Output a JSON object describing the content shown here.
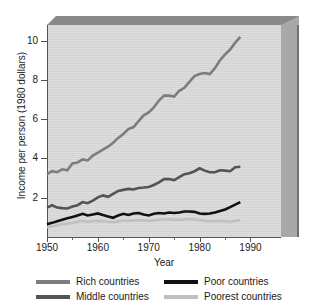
{
  "chart_data": {
    "type": "line",
    "title": "",
    "xlabel": "Year",
    "ylabel": "Income per person (1980 dollars)",
    "xlim": [
      1950,
      1996
    ],
    "ylim": [
      0,
      10.8
    ],
    "xticks": [
      1950,
      1960,
      1970,
      1980,
      1990
    ],
    "xticks_minor": [
      1955,
      1965,
      1975,
      1985
    ],
    "yticks": [
      2,
      4,
      6,
      8,
      10
    ],
    "grid": false,
    "legend_position": "below",
    "x": [
      1950,
      1951,
      1952,
      1953,
      1954,
      1955,
      1956,
      1957,
      1958,
      1959,
      1960,
      1961,
      1962,
      1963,
      1964,
      1965,
      1966,
      1967,
      1968,
      1969,
      1970,
      1971,
      1972,
      1973,
      1974,
      1975,
      1976,
      1977,
      1978,
      1979,
      1980,
      1981,
      1982,
      1983,
      1984,
      1985,
      1986,
      1987,
      1988
    ],
    "series": [
      {
        "name": "Rich countries",
        "color": "#7d7d7d",
        "width": 2.6,
        "values": [
          3.2,
          3.35,
          3.3,
          3.45,
          3.4,
          3.75,
          3.8,
          3.95,
          3.9,
          4.15,
          4.3,
          4.45,
          4.6,
          4.8,
          5.05,
          5.25,
          5.5,
          5.6,
          5.9,
          6.2,
          6.35,
          6.6,
          6.95,
          7.2,
          7.2,
          7.15,
          7.45,
          7.6,
          7.9,
          8.2,
          8.3,
          8.35,
          8.3,
          8.6,
          9.0,
          9.3,
          9.55,
          9.9,
          10.2
        ]
      },
      {
        "name": "Middle countries",
        "color": "#545454",
        "width": 2.6,
        "values": [
          1.5,
          1.62,
          1.5,
          1.47,
          1.45,
          1.55,
          1.62,
          1.78,
          1.72,
          1.85,
          2.02,
          2.12,
          2.05,
          2.2,
          2.35,
          2.4,
          2.45,
          2.42,
          2.5,
          2.52,
          2.55,
          2.65,
          2.78,
          2.95,
          2.95,
          2.9,
          3.05,
          3.2,
          3.25,
          3.35,
          3.5,
          3.38,
          3.3,
          3.3,
          3.4,
          3.38,
          3.35,
          3.55,
          3.58
        ]
      },
      {
        "name": "Poor countries",
        "color": "#111111",
        "width": 2.6,
        "values": [
          0.65,
          0.72,
          0.8,
          0.88,
          0.95,
          1.02,
          1.1,
          1.18,
          1.1,
          1.15,
          1.2,
          1.12,
          1.05,
          0.98,
          1.1,
          1.18,
          1.12,
          1.2,
          1.22,
          1.15,
          1.1,
          1.18,
          1.22,
          1.2,
          1.25,
          1.22,
          1.25,
          1.3,
          1.3,
          1.28,
          1.2,
          1.18,
          1.2,
          1.25,
          1.32,
          1.4,
          1.52,
          1.65,
          1.78
        ]
      },
      {
        "name": "Poorest countries",
        "color": "#c0c0c0",
        "width": 2.6,
        "values": [
          0.5,
          0.55,
          0.6,
          0.65,
          0.68,
          0.72,
          0.78,
          0.82,
          0.78,
          0.8,
          0.82,
          0.8,
          0.78,
          0.76,
          0.8,
          0.84,
          0.82,
          0.84,
          0.86,
          0.84,
          0.82,
          0.86,
          0.88,
          0.9,
          0.9,
          0.88,
          0.88,
          0.9,
          0.92,
          0.9,
          0.86,
          0.82,
          0.8,
          0.8,
          0.82,
          0.8,
          0.78,
          0.82,
          0.86
        ]
      }
    ]
  },
  "legend": {
    "items": [
      {
        "label": "Rich countries",
        "color": "#7d7d7d"
      },
      {
        "label": "Poor countries",
        "color": "#111111"
      },
      {
        "label": "Middle countries",
        "color": "#545454"
      },
      {
        "label": "Poorest countries",
        "color": "#c0c0c0"
      }
    ]
  }
}
